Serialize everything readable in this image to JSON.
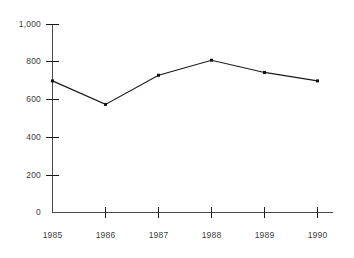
{
  "chart_data": {
    "type": "line",
    "title": "",
    "subtitle": "",
    "xlabel": "",
    "ylabel": "",
    "categories": [
      "1985",
      "1986",
      "1987",
      "1988",
      "1989",
      "1990"
    ],
    "x": [
      1985,
      1986,
      1987,
      1988,
      1989,
      1990
    ],
    "values": [
      700,
      575,
      730,
      810,
      745,
      700
    ],
    "series": [
      {
        "name": "",
        "values": [
          700,
          575,
          730,
          810,
          745,
          700
        ]
      }
    ],
    "ylim": [
      0,
      1000
    ],
    "yticks": [
      0,
      200,
      400,
      600,
      800,
      1000
    ],
    "ytick_labels": [
      "0",
      "200",
      "400",
      "600",
      "800",
      "1,000"
    ],
    "xtick_labels": [
      "1985",
      "1986",
      "1987",
      "1988",
      "1989",
      "1990"
    ],
    "grid": false,
    "legend": false,
    "legend_position": "none",
    "line_color": "#1a1a1a",
    "marker": "square",
    "marker_color": "#111111",
    "axis_color": "#4a4a4a",
    "background_color": "#ffffff"
  }
}
